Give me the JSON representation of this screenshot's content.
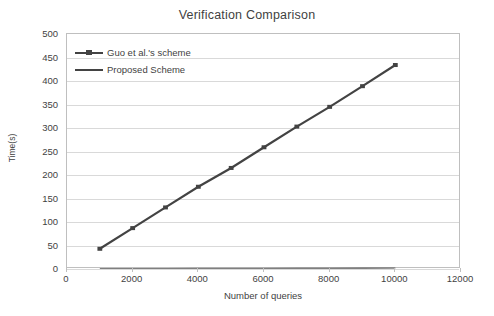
{
  "chart_data": {
    "type": "line",
    "title": "Verification Comparison",
    "xlabel": "Number of queries",
    "ylabel": "Time(s)",
    "xlim": [
      0,
      12000
    ],
    "ylim": [
      0,
      500
    ],
    "xticks": [
      0,
      2000,
      4000,
      6000,
      8000,
      10000,
      12000
    ],
    "yticks": [
      0,
      50,
      100,
      150,
      200,
      250,
      300,
      350,
      400,
      450,
      500
    ],
    "xtick_labels": [
      "0",
      "2000",
      "4000",
      "6000",
      "8000",
      "10000",
      "12000"
    ],
    "ytick_labels": [
      "0",
      "50",
      "100",
      "150",
      "200",
      "250",
      "300",
      "350",
      "400",
      "450",
      "500"
    ],
    "grid": "horizontal",
    "legend_position": "upper-left-inside",
    "x": [
      1000,
      2000,
      3000,
      4000,
      5000,
      6000,
      7000,
      8000,
      9000,
      10000
    ],
    "series": [
      {
        "name": "Guo et al.'s scheme",
        "color": "#434343",
        "marker": "square",
        "values": [
          43,
          87,
          131,
          175,
          215,
          259,
          303,
          345,
          389,
          434
        ]
      },
      {
        "name": "Proposed Scheme",
        "color": "#7f7f7f",
        "marker": "none",
        "values": [
          0.2,
          0.4,
          0.6,
          0.8,
          1.0,
          1.2,
          1.4,
          1.6,
          1.8,
          2.0
        ]
      }
    ]
  },
  "legend": {
    "entries": [
      {
        "label": "Guo et al.'s scheme"
      },
      {
        "label": "Proposed Scheme"
      }
    ]
  }
}
